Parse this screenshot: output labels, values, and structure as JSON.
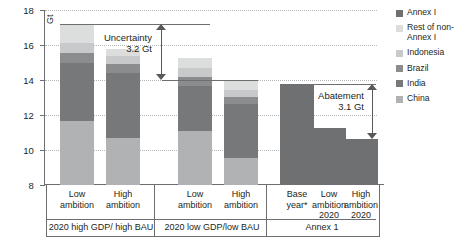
{
  "axis": {
    "unit": "Gt",
    "ticks": [
      "18",
      "16",
      "14",
      "12",
      "10",
      "8"
    ],
    "ymin": 8,
    "ymax": 18
  },
  "legend": {
    "items": [
      {
        "label": "Annex I",
        "color": "#6f7072"
      },
      {
        "label": "Rest of non-Annex I",
        "color": "#dcdddd"
      },
      {
        "label": "Indonesia",
        "color": "#c8c9ca"
      },
      {
        "label": "Brazil",
        "color": "#8b8c8e"
      },
      {
        "label": "India",
        "color": "#76787a"
      },
      {
        "label": "China",
        "color": "#b0b2b3"
      }
    ]
  },
  "annotations": {
    "uncertainty": {
      "title": "Uncertainty",
      "value": "3.2 Gt",
      "from": 17.2,
      "to": 14.0
    },
    "abatement": {
      "title": "Abatement",
      "value": "3.1 Gt",
      "from": 13.75,
      "to": 10.65
    }
  },
  "groups": [
    {
      "name": "2020 high GDP/ high BAU",
      "bars": [
        "Low ambition",
        "High ambition"
      ]
    },
    {
      "name": "2020 low GDP/low BAU",
      "bars": [
        "Low ambition",
        "High ambition"
      ]
    },
    {
      "name": "Annex 1",
      "bars": [
        "Base year*",
        "Low ambition 2020",
        "High ambition 2020"
      ]
    }
  ],
  "chart_data": {
    "type": "bar",
    "title": "",
    "xlabel": "",
    "ylabel": "Gt",
    "ylim": [
      8,
      18
    ],
    "grid": true,
    "legend_position": "right",
    "stacked": true,
    "categories": [
      "Low ambition (2020 high GDP/high BAU)",
      "High ambition (2020 high GDP/high BAU)",
      "Low ambition (2020 low GDP/low BAU)",
      "High ambition (2020 low GDP/low BAU)",
      "Base year* (Annex 1)",
      "Low ambition 2020 (Annex 1)",
      "High ambition 2020 (Annex 1)"
    ],
    "series": [
      {
        "name": "China",
        "color": "#b0b2b3",
        "values": [
          11.65,
          10.7,
          11.1,
          9.55,
          0,
          0,
          0
        ]
      },
      {
        "name": "India",
        "color": "#76787a",
        "values": [
          3.3,
          3.7,
          2.55,
          3.1,
          0,
          0,
          0
        ]
      },
      {
        "name": "Brazil",
        "color": "#8b8c8e",
        "values": [
          0.62,
          0.5,
          0.55,
          0.4,
          0,
          0,
          0
        ]
      },
      {
        "name": "Indonesia",
        "color": "#c8c9ca",
        "values": [
          0.55,
          0.45,
          0.5,
          0.4,
          0,
          0,
          0
        ]
      },
      {
        "name": "Rest of non-Annex I",
        "color": "#dcdddd",
        "values": [
          1.03,
          0.45,
          0.55,
          0.55,
          0,
          0,
          0
        ]
      },
      {
        "name": "Annex I",
        "color": "#6f7072",
        "values": [
          0,
          0,
          0,
          0,
          13.75,
          11.25,
          10.65
        ]
      }
    ],
    "totals": [
      17.15,
      15.8,
      15.25,
      14.0,
      13.75,
      11.25,
      10.65
    ],
    "tick_labels": [
      "8",
      "10",
      "12",
      "14",
      "16",
      "18"
    ],
    "annotations": [
      {
        "text": "Uncertainty 3.2 Gt",
        "span": [
          14.0,
          17.2
        ]
      },
      {
        "text": "Abatement 3.1 Gt",
        "span": [
          10.65,
          13.75
        ]
      }
    ]
  }
}
